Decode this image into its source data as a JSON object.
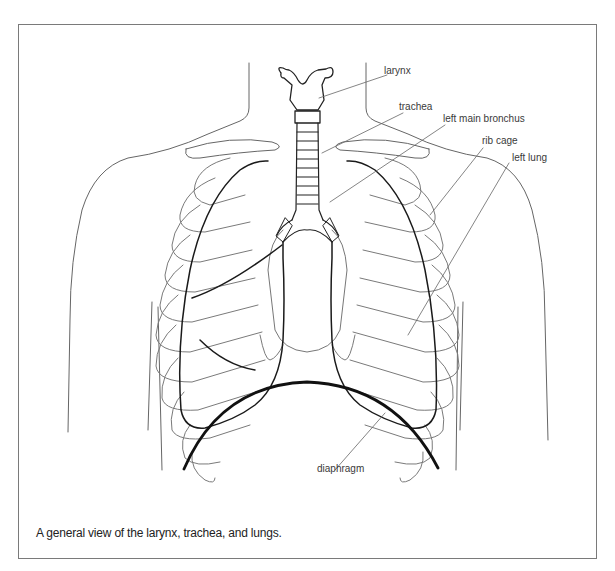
{
  "figure": {
    "caption": "A general view of the larynx, trachea, and lungs.",
    "labels": {
      "larynx": "larynx",
      "trachea": "trachea",
      "left_main_bronchus": "left main bronchus",
      "rib_cage": "rib cage",
      "left_lung": "left lung",
      "diaphragm": "diaphragm"
    }
  },
  "colors": {
    "frame": "#7a7a7a",
    "outline": "#555555",
    "rib": "#7a7a7a",
    "lung": "#1a1a1a",
    "diaphragm": "#111111",
    "leader": "#666666"
  }
}
